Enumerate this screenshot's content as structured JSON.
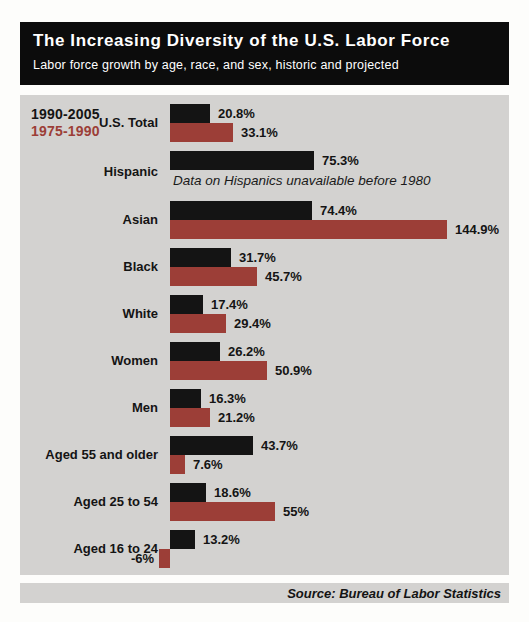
{
  "header": {
    "title": "The Increasing Diversity of the U.S. Labor Force",
    "subtitle": "Labor force growth by age, race, and sex, historic and projected"
  },
  "legend": {
    "series1_label": "1990-2005",
    "series2_label": "1975-1990"
  },
  "source": "Source: Bureau of Labor Statistics",
  "colors": {
    "series1": "#141414",
    "series2": "#9c3e37",
    "panel_background": "#d3d2d0",
    "header_background": "#0c0c0c"
  },
  "chart_data": {
    "type": "bar",
    "orientation": "horizontal",
    "unit": "%",
    "title": "The Increasing Diversity of the U.S. Labor Force",
    "subtitle": "Labor force growth by age, race, and sex, historic and projected",
    "source": "Source: Bureau of Labor Statistics",
    "series": [
      {
        "name": "1990-2005",
        "color": "#141414"
      },
      {
        "name": "1975-1990",
        "color": "#9c3e37"
      }
    ],
    "categories": [
      "U.S. Total",
      "Hispanic",
      "Asian",
      "Black",
      "White",
      "Women",
      "Men",
      "Aged 55 and older",
      "Aged 25 to 54",
      "Aged 16 to 24"
    ],
    "groups": [
      {
        "label": "U.S. Total",
        "values": [
          20.8,
          33.1
        ],
        "value_labels": [
          "20.8%",
          "33.1%"
        ],
        "note": null
      },
      {
        "label": "Hispanic",
        "values": [
          75.3,
          null
        ],
        "value_labels": [
          "75.3%",
          null
        ],
        "note": "Data on Hispanics unavailable before 1980"
      },
      {
        "label": "Asian",
        "values": [
          74.4,
          144.9
        ],
        "value_labels": [
          "74.4%",
          "144.9%"
        ],
        "note": null
      },
      {
        "label": "Black",
        "values": [
          31.7,
          45.7
        ],
        "value_labels": [
          "31.7%",
          "45.7%"
        ],
        "note": null
      },
      {
        "label": "White",
        "values": [
          17.4,
          29.4
        ],
        "value_labels": [
          "17.4%",
          "29.4%"
        ],
        "note": null
      },
      {
        "label": "Women",
        "values": [
          26.2,
          50.9
        ],
        "value_labels": [
          "26.2%",
          "50.9%"
        ],
        "note": null
      },
      {
        "label": "Men",
        "values": [
          16.3,
          21.2
        ],
        "value_labels": [
          "16.3%",
          "21.2%"
        ],
        "note": null
      },
      {
        "label": "Aged 55 and older",
        "values": [
          43.7,
          7.6
        ],
        "value_labels": [
          "43.7%",
          "7.6%"
        ],
        "note": null
      },
      {
        "label": "Aged 25 to 54",
        "values": [
          18.6,
          55
        ],
        "value_labels": [
          "18.6%",
          "55%"
        ],
        "note": null
      },
      {
        "label": "Aged 16 to 24",
        "values": [
          13.2,
          -6
        ],
        "value_labels": [
          "13.2%",
          "-6%"
        ],
        "note": null
      }
    ],
    "x_axis": {
      "min": -6,
      "max": 144.9,
      "visible": false
    },
    "grid": false,
    "legend_position": "top-left"
  }
}
